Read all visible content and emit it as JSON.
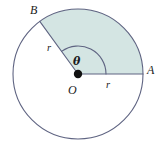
{
  "figure": {
    "name": "circle-sector-diagram",
    "background_color": "#ffffff",
    "labels": {
      "point_b": "B",
      "point_a": "A",
      "center_o": "O",
      "angle": "θ",
      "radius_ob": "r",
      "radius_oa": "r"
    },
    "colors": {
      "outline": "#5f6482",
      "sector_fill": "#d4e5e3",
      "center_dot": "#111111",
      "label_text": "#1b1b22"
    },
    "geometry": {
      "center_x": 78,
      "center_y": 74,
      "radius": 65,
      "angle_oa_degrees": 0,
      "angle_ob_degrees": 126,
      "arc_marker_radius": 28,
      "center_dot_radius": 4.2,
      "stroke_width": 1.1
    }
  },
  "chart_data": {
    "type": "diagram",
    "title": "",
    "elements": [
      {
        "kind": "circle",
        "label": "",
        "center": [
          78,
          74
        ],
        "radius": 65
      },
      {
        "kind": "sector",
        "label": "shaded sector AOB",
        "start_angle_deg": 0,
        "end_angle_deg": 126,
        "fill": "#d4e5e3"
      },
      {
        "kind": "radius",
        "label": "r",
        "from": "O",
        "to": "A",
        "angle_deg": 0
      },
      {
        "kind": "radius",
        "label": "r",
        "from": "O",
        "to": "B",
        "angle_deg": 126
      },
      {
        "kind": "arc-marker",
        "label": "θ",
        "radius": 28,
        "start_angle_deg": 0,
        "end_angle_deg": 126
      },
      {
        "kind": "point",
        "label": "O",
        "position": [
          78,
          74
        ]
      },
      {
        "kind": "point",
        "label": "A",
        "position": [
          143,
          74
        ]
      },
      {
        "kind": "point",
        "label": "B",
        "position": [
          40,
          21
        ]
      }
    ]
  }
}
